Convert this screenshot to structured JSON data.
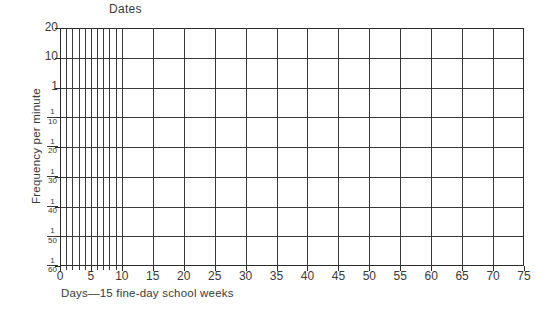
{
  "chart_data": {
    "type": "line",
    "title": "Dates",
    "subtitle": "",
    "xlabel": "Days—15 fine-day school weeks",
    "ylabel": "Frequency per minute",
    "grid": true,
    "legend": null,
    "series": [],
    "annotations": [],
    "note": "Blank Standard Celeration Chart (Precision Teaching daily chart) — no plotted data points",
    "xlim": [
      0,
      75
    ],
    "x_tick_labels": [
      "0",
      "5",
      "10",
      "15",
      "20",
      "25",
      "30",
      "35",
      "40",
      "45",
      "50",
      "55",
      "60",
      "65",
      "70",
      "75"
    ],
    "x_tick_values": [
      0,
      5,
      10,
      15,
      20,
      25,
      30,
      35,
      40,
      45,
      50,
      55,
      60,
      65,
      70,
      75
    ],
    "x_minor_daily_lines_range": [
      0,
      10
    ],
    "ylim_labels_top_to_bottom": [
      "20",
      "10",
      "1",
      "1/10",
      "1/20",
      "1/30",
      "1/40",
      "1/50",
      "1/60"
    ],
    "y_ticks": [
      {
        "label": "20",
        "num": "",
        "den": "",
        "whole": "20"
      },
      {
        "label": "10",
        "num": "",
        "den": "",
        "whole": "10"
      },
      {
        "label": "1",
        "num": "",
        "den": "",
        "whole": "1"
      },
      {
        "label": "1/10",
        "num": "1",
        "den": "10",
        "whole": ""
      },
      {
        "label": "1/20",
        "num": "1",
        "den": "20",
        "whole": ""
      },
      {
        "label": "1/30",
        "num": "1",
        "den": "30",
        "whole": ""
      },
      {
        "label": "1/40",
        "num": "1",
        "den": "40",
        "whole": ""
      },
      {
        "label": "1/50",
        "num": "1",
        "den": "50",
        "whole": ""
      },
      {
        "label": "1/60",
        "num": "1",
        "den": "60",
        "whole": ""
      }
    ]
  },
  "colors": {
    "background": "#ffffff",
    "grid_line": "#3a3a3a",
    "frame_line": "#2b2b2b",
    "text": "#3a3a3a"
  }
}
